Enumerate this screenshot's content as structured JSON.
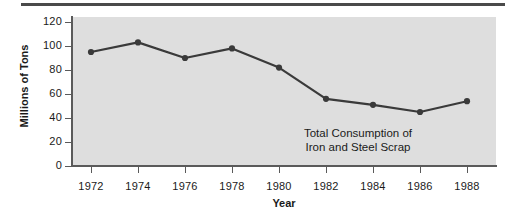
{
  "figure": {
    "name": "line-chart-figure",
    "background_color": "#ffffff",
    "panel_color": "#dedede",
    "rule_color": "#4a4a4a",
    "axis_color": "#5a5a5a",
    "series_color": "#3a3a3a"
  },
  "chart_data": {
    "type": "line",
    "title": "",
    "annotation": "Total Consumption of\nIron and Steel Scrap",
    "annotation_lines": [
      "Total Consumption of",
      "Iron and Steel Scrap"
    ],
    "xlabel": "Year",
    "ylabel": "Millions of Tons",
    "categories": [
      1972,
      1974,
      1976,
      1978,
      1980,
      1982,
      1984,
      1986,
      1988
    ],
    "x": [
      1972,
      1974,
      1976,
      1978,
      1980,
      1982,
      1984,
      1986,
      1988
    ],
    "values": [
      95,
      103,
      90,
      98,
      82,
      56,
      51,
      45,
      54
    ],
    "series": [
      {
        "name": "Total Consumption of Iron and Steel Scrap",
        "values": [
          95,
          103,
          90,
          98,
          82,
          56,
          51,
          45,
          54
        ]
      }
    ],
    "xtick_labels": [
      "1972",
      "1974",
      "1976",
      "1978",
      "1980",
      "1982",
      "1984",
      "1986",
      "1988"
    ],
    "ytick_labels": [
      "0",
      "20",
      "40",
      "60",
      "80",
      "100",
      "120"
    ],
    "yticks": [
      0,
      20,
      40,
      60,
      80,
      100,
      120
    ],
    "ylim": [
      0,
      128
    ],
    "xlim": [
      1971,
      1989
    ],
    "grid": false,
    "legend": "none",
    "marker": "circle",
    "line_color": "#3a3a3a",
    "marker_color": "#3a3a3a"
  }
}
